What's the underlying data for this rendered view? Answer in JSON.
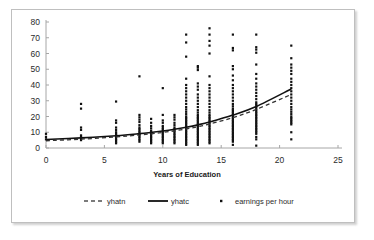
{
  "chart_data": {
    "type": "scatter",
    "title": "",
    "xlabel": "Years of Education",
    "ylabel": "",
    "xlim": [
      0,
      25
    ],
    "ylim": [
      0,
      80
    ],
    "xticks": [
      "0",
      "5",
      "10",
      "15",
      "20",
      "25"
    ],
    "yticks": [
      "0",
      "10",
      "20",
      "30",
      "40",
      "50",
      "60",
      "70",
      "80"
    ],
    "grid": false,
    "legend_position": "bottom",
    "legend": [
      {
        "name": "yhatn",
        "marker": "dashed-line"
      },
      {
        "name": "yhatc",
        "marker": "solid-line"
      },
      {
        "name": "earnings per hour",
        "marker": "dot"
      }
    ],
    "series": [
      {
        "name": "yhatn",
        "type": "line",
        "style": "dashed",
        "x": [
          0,
          3,
          6,
          8,
          9,
          10,
          11,
          12,
          13,
          14,
          16,
          18,
          21
        ],
        "values": [
          4.6,
          5.6,
          7.0,
          8.3,
          9.0,
          9.9,
          10.9,
          12.1,
          13.5,
          15.2,
          19.3,
          24.5,
          34.0
        ]
      },
      {
        "name": "yhatc",
        "type": "line",
        "style": "solid",
        "x": [
          0,
          3,
          6,
          8,
          9,
          10,
          11,
          12,
          13,
          14,
          16,
          18,
          21
        ],
        "values": [
          5.4,
          6.4,
          7.8,
          9.1,
          9.9,
          10.8,
          11.9,
          13.2,
          14.7,
          16.5,
          20.9,
          26.4,
          37.5
        ]
      },
      {
        "name": "earnings per hour",
        "type": "scatter",
        "points": [
          {
            "x": 0,
            "y": [
              9.0,
              7.0,
              5.5
            ]
          },
          {
            "x": 3,
            "y": [
              28.0,
              25.0,
              13.0,
              11.5,
              8.0,
              7.0,
              6.0,
              5.0
            ]
          },
          {
            "x": 6,
            "y": [
              29.5,
              17.5,
              16.0,
              13.0,
              11.5,
              10.0,
              9.0,
              8.0,
              7.0,
              6.0,
              5.0,
              4.0,
              3.0
            ]
          },
          {
            "x": 8,
            "y": [
              45.5,
              21.0,
              19.5,
              18.0,
              16.5,
              14.5,
              13.0,
              12.0,
              11.0,
              10.0,
              9.0,
              8.0,
              7.0,
              6.0,
              5.0,
              4.0
            ]
          },
          {
            "x": 9,
            "y": [
              18.5,
              16.0,
              14.0,
              12.5,
              11.0,
              10.0,
              9.0,
              8.0,
              7.0,
              6.0,
              5.0,
              4.0,
              3.0
            ]
          },
          {
            "x": 10,
            "y": [
              38.0,
              21.0,
              17.5,
              16.0,
              14.0,
              13.0,
              12.0,
              11.0,
              10.0,
              9.0,
              8.0,
              7.0,
              6.0,
              5.0,
              4.0,
              3.0
            ]
          },
          {
            "x": 11,
            "y": [
              21.0,
              19.5,
              18.0,
              16.0,
              14.5,
              13.0,
              12.0,
              11.0,
              10.0,
              9.0,
              8.0,
              7.0,
              6.0,
              5.0,
              4.0,
              3.0
            ]
          },
          {
            "x": 12,
            "y": [
              72.0,
              67.0,
              58.0,
              44.0,
              40.0,
              38.0,
              36.0,
              34.0,
              32.0,
              30.0,
              28.0,
              26.0,
              24.5,
              23.0,
              21.5,
              20.0,
              19.0,
              18.0,
              17.0,
              16.0,
              15.0,
              14.0,
              13.0,
              12.0,
              11.0,
              10.0,
              9.0,
              8.0,
              7.0,
              6.0,
              5.0,
              4.0,
              3.0,
              2.0
            ]
          },
          {
            "x": 13,
            "y": [
              52.0,
              51.0,
              49.5,
              41.0,
              39.0,
              37.0,
              34.0,
              32.0,
              30.0,
              28.0,
              26.0,
              24.0,
              22.5,
              21.0,
              20.0,
              19.0,
              18.0,
              17.0,
              16.0,
              15.0,
              14.0,
              13.0,
              12.0,
              11.0,
              10.0,
              9.0,
              8.0,
              7.0,
              6.0,
              5.0,
              4.0,
              3.0,
              2.0
            ]
          },
          {
            "x": 14,
            "y": [
              76.0,
              72.0,
              68.0,
              65.0,
              60.0,
              45.5,
              40.0,
              38.0,
              36.0,
              34.0,
              32.0,
              30.0,
              28.0,
              26.0,
              24.0,
              22.5,
              21.0,
              20.0,
              19.0,
              18.0,
              17.0,
              16.0,
              15.0,
              14.0,
              13.0,
              12.0,
              11.0,
              10.0,
              9.0,
              8.0,
              7.0,
              6.0,
              5.0,
              4.0,
              3.0
            ]
          },
          {
            "x": 16,
            "y": [
              72.0,
              63.5,
              62.0,
              52.0,
              50.0,
              46.0,
              43.0,
              40.0,
              38.0,
              36.0,
              34.0,
              32.0,
              30.0,
              28.0,
              26.5,
              25.0,
              24.0,
              23.0,
              22.0,
              21.0,
              20.0,
              19.0,
              18.0,
              17.0,
              16.0,
              15.0,
              14.0,
              13.0,
              12.0,
              11.0,
              10.0,
              9.0,
              8.0,
              7.0,
              6.0,
              5.0,
              4.0,
              2.0
            ]
          },
          {
            "x": 18,
            "y": [
              72.0,
              64.0,
              62.5,
              60.5,
              53.0,
              47.0,
              44.0,
              41.0,
              39.0,
              37.0,
              35.0,
              33.0,
              31.0,
              29.0,
              28.0,
              27.0,
              26.0,
              25.0,
              24.0,
              23.0,
              22.0,
              21.0,
              20.0,
              19.0,
              18.0,
              17.0,
              16.0,
              15.0,
              14.0,
              13.0,
              12.0,
              11.0,
              10.0,
              9.0,
              7.0,
              5.5,
              1.5
            ]
          },
          {
            "x": 21,
            "y": [
              65.0,
              57.0,
              53.0,
              51.0,
              49.0,
              47.0,
              44.0,
              42.0,
              40.0,
              38.0,
              36.0,
              34.0,
              32.0,
              30.0,
              28.0,
              26.0,
              24.5,
              23.0,
              21.5,
              20.0,
              19.0,
              18.0,
              17.0,
              16.0,
              15.0,
              10.0,
              5.5
            ]
          }
        ]
      }
    ]
  }
}
